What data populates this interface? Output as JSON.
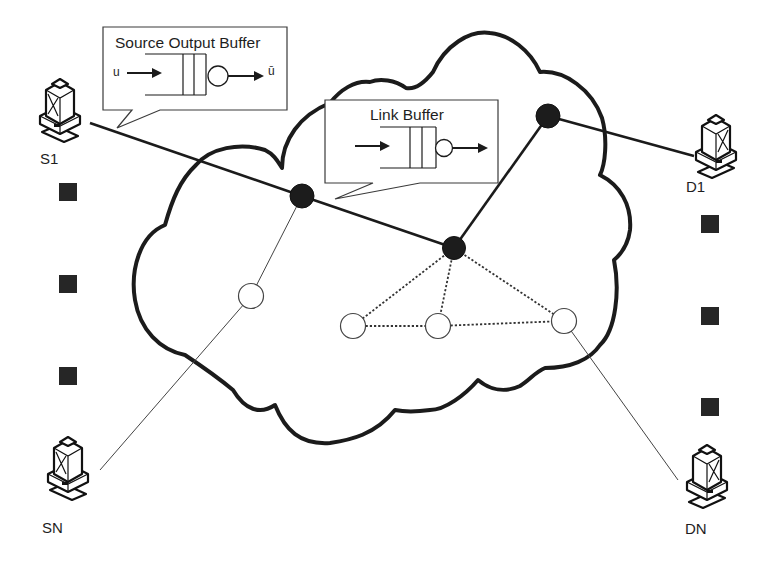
{
  "diagram": {
    "type": "network-topology",
    "cloud": {
      "label": ""
    },
    "callouts": {
      "source_output_buffer": {
        "title": "Source Output Buffer",
        "input_label": "u",
        "output_label": "ū"
      },
      "link_buffer": {
        "title": "Link Buffer"
      }
    },
    "hosts": {
      "s1": {
        "label": "S1",
        "role": "source"
      },
      "sn": {
        "label": "SN",
        "role": "source"
      },
      "d1": {
        "label": "D1",
        "role": "destination"
      },
      "dn": {
        "label": "DN",
        "role": "destination"
      }
    },
    "nodes": [
      {
        "id": "r1",
        "style": "filled"
      },
      {
        "id": "r2",
        "style": "filled"
      },
      {
        "id": "r3",
        "style": "filled"
      },
      {
        "id": "w1",
        "style": "hollow"
      },
      {
        "id": "w2",
        "style": "hollow"
      },
      {
        "id": "w3",
        "style": "hollow"
      },
      {
        "id": "w4",
        "style": "hollow"
      }
    ],
    "links": [
      {
        "from": "S1",
        "to": "r1",
        "style": "thick"
      },
      {
        "from": "r1",
        "to": "r2",
        "style": "thick"
      },
      {
        "from": "r2",
        "to": "r3",
        "style": "thick"
      },
      {
        "from": "r3",
        "to": "D1",
        "style": "thick"
      },
      {
        "from": "r1",
        "to": "w1",
        "style": "thin"
      },
      {
        "from": "w1",
        "to": "SN",
        "style": "thin"
      },
      {
        "from": "r2",
        "to": "w2",
        "style": "dotted"
      },
      {
        "from": "r2",
        "to": "w3",
        "style": "dotted"
      },
      {
        "from": "r2",
        "to": "w4",
        "style": "dotted"
      },
      {
        "from": "w2",
        "to": "w3",
        "style": "dotted"
      },
      {
        "from": "w3",
        "to": "w4",
        "style": "dotted"
      },
      {
        "from": "w4",
        "to": "DN",
        "style": "thin"
      }
    ],
    "ellipsis_markers": {
      "left_count": 3,
      "right_count": 3
    },
    "colors": {
      "ink": "#1b1b1b",
      "background": "#ffffff",
      "hollow_node_fill": "#ffffff"
    }
  }
}
